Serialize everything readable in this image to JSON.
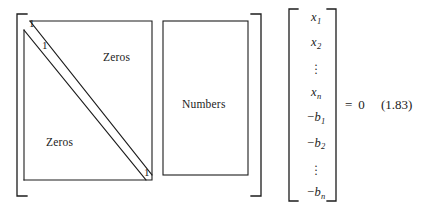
{
  "figure": {
    "kind": "matrix-equation-diagram",
    "equation_number": "(1.83)",
    "ink_color": "#1c1c1c",
    "background_color": "#ffffff",
    "matrix": {
      "block_upper_right_label": "Zeros",
      "block_lower_left_label": "Zeros",
      "block_right_label": "Numbers",
      "diagonal_markers": [
        {
          "id": "one-top",
          "text": "1"
        },
        {
          "id": "one-second",
          "text": "1"
        },
        {
          "id": "one-bottom",
          "text": "1"
        }
      ]
    },
    "vector": {
      "entries": [
        {
          "type": "symbol",
          "negative": false,
          "base": "x",
          "sub": "1"
        },
        {
          "type": "symbol",
          "negative": false,
          "base": "x",
          "sub": "2"
        },
        {
          "type": "vdots"
        },
        {
          "type": "symbol",
          "negative": false,
          "base": "x",
          "sub": "n"
        },
        {
          "type": "symbol",
          "negative": true,
          "base": "b",
          "sub": "1"
        },
        {
          "type": "symbol",
          "negative": true,
          "base": "b",
          "sub": "2"
        },
        {
          "type": "vdots"
        },
        {
          "type": "symbol",
          "negative": true,
          "base": "b",
          "sub": "n"
        }
      ]
    },
    "rhs": {
      "equals": "=",
      "value": "0"
    }
  }
}
